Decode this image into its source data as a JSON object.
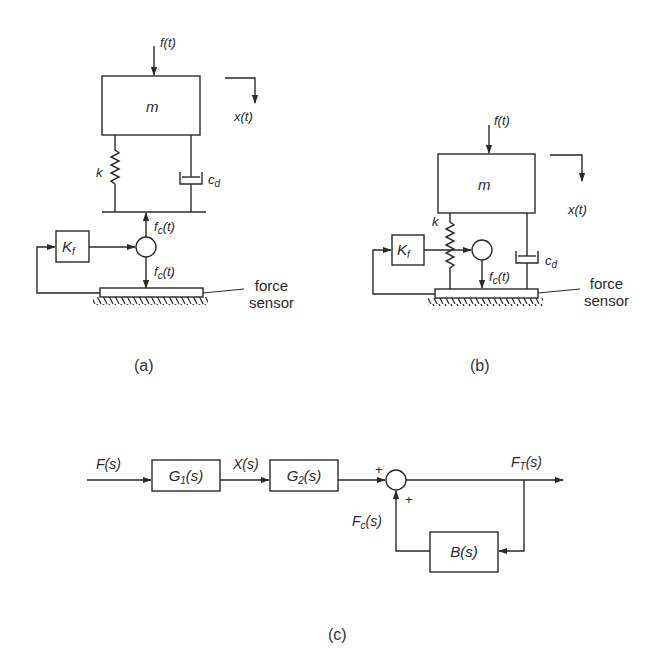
{
  "figure_a": {
    "caption": "(a)",
    "force_input": "f(t)",
    "mass": "m",
    "displacement": "x(t)",
    "spring": "k",
    "damper": {
      "base": "c",
      "sub": "d"
    },
    "gain": {
      "base": "K",
      "sub": "f"
    },
    "control_force_up": {
      "base": "f",
      "sub": "c",
      "tail": "(t)"
    },
    "control_force_down": {
      "base": "f",
      "sub": "c",
      "tail": "(t)"
    },
    "sensor_label": [
      "force",
      "sensor"
    ]
  },
  "figure_b": {
    "caption": "(b)",
    "force_input": "f(t)",
    "mass": "m",
    "displacement": "x(t)",
    "spring": "k",
    "damper": {
      "base": "c",
      "sub": "d"
    },
    "gain": {
      "base": "K",
      "sub": "f"
    },
    "control_force": {
      "base": "f",
      "sub": "c",
      "tail": "(t)"
    },
    "sensor_label": [
      "force",
      "sensor"
    ]
  },
  "figure_c": {
    "caption": "(c)",
    "input": "F(s)",
    "block1": {
      "base": "G",
      "sub": "1",
      "tail": "(s)"
    },
    "intermediate": "X(s)",
    "block2": {
      "base": "G",
      "sub": "2",
      "tail": "(s)"
    },
    "sum_signs": [
      "+",
      "+"
    ],
    "output": {
      "base": "F",
      "sub": "T",
      "tail": "(s)"
    },
    "feedback_signal": {
      "base": "F",
      "sub": "c",
      "tail": "(s)"
    },
    "feedback_block": "B(s)"
  },
  "colors": {
    "line": "#2a2a2a",
    "background": "#ffffff"
  }
}
